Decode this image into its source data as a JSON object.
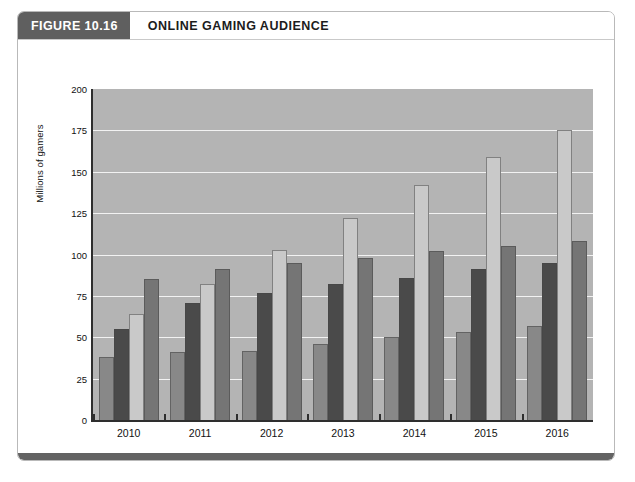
{
  "figure": {
    "number_label": "FIGURE 10.16",
    "title": "ONLINE GAMING AUDIENCE"
  },
  "colors": {
    "header_badge": "#5f5f5f",
    "plot_background": "#b4b4b4",
    "gridline": "#f2f2f2",
    "axis": "#2e2e2e",
    "bottom_rule": "#636363",
    "console": "#888888",
    "social": "#4a4a4a",
    "mobile": "#c9c9c9",
    "casual": "#757575"
  },
  "chart_data": {
    "type": "bar",
    "title": "ONLINE GAMING AUDIENCE",
    "xlabel": "",
    "ylabel": "Millions of gamers",
    "ylim": [
      0,
      200
    ],
    "ytick_step": 25,
    "yticks": [
      "200",
      "175",
      "150",
      "125",
      "100",
      "75",
      "50",
      "25",
      "0"
    ],
    "grid": true,
    "legend_position": "bottom",
    "categories": [
      "2010",
      "2011",
      "2012",
      "2013",
      "2014",
      "2015",
      "2016"
    ],
    "series": [
      {
        "name": "Console gamers",
        "color": "#888888",
        "values": [
          38,
          41,
          42,
          46,
          50,
          53,
          57
        ]
      },
      {
        "name": "Social gamers",
        "color": "#4a4a4a",
        "values": [
          55,
          71,
          77,
          82,
          86,
          91,
          95
        ]
      },
      {
        "name": "Mobile gamers",
        "color": "#c9c9c9",
        "values": [
          64,
          82,
          103,
          122,
          142,
          159,
          175
        ]
      },
      {
        "name": "Casual gamers",
        "color": "#757575",
        "values": [
          85,
          91,
          95,
          98,
          102,
          105,
          108
        ]
      }
    ]
  }
}
